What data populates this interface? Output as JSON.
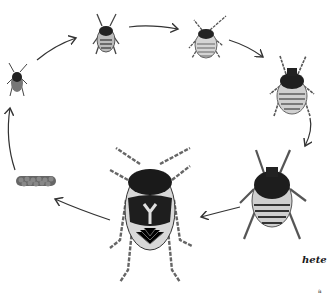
{
  "figure": {
    "stages": [
      {
        "id": "eggs",
        "name": "Egg mass"
      },
      {
        "id": "nymph-1",
        "name": "First instar nymph"
      },
      {
        "id": "nymph-2",
        "name": "Second instar nymph"
      },
      {
        "id": "nymph-3",
        "name": "Third instar nymph"
      },
      {
        "id": "nymph-4",
        "name": "Fourth instar nymph"
      },
      {
        "id": "nymph-5",
        "name": "Fifth instar nymph"
      },
      {
        "id": "adult",
        "name": "Adult bug"
      }
    ],
    "label_partial": "hete",
    "corner_mark": "a"
  },
  "colors": {
    "ink": "#1a1a1a",
    "shade": "#555555",
    "light": "#bdbdbd",
    "paper": "#ffffff"
  }
}
